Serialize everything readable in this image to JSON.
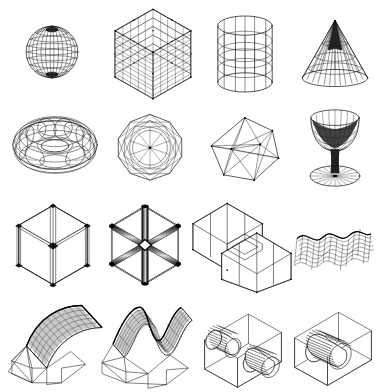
{
  "plate": {
    "title": "Wireframe 3D Geometry Plate",
    "background_color": "#ffffff",
    "ink_color": "#111111",
    "width": 380,
    "height": 392,
    "grid": {
      "columns": 4,
      "rows": 4,
      "cell_count": 16
    },
    "style_note": "monochrome line-art hidden-line wireframe renderings"
  },
  "figures": [
    {
      "index": 1,
      "row": 1,
      "column": 1,
      "name": "sphere-wireframe",
      "label": "Sphere",
      "description": "Latitude-longitude mesh sphere with dense poles",
      "shading": "hidden-line",
      "mesh": {
        "meridians": 16,
        "parallels": 12
      },
      "x": 14,
      "y": 14,
      "w": 76,
      "h": 76
    },
    {
      "index": 2,
      "row": 1,
      "column": 2,
      "name": "lattice-cube-grid",
      "label": "Lattice Cube",
      "description": "Isometric cube filled with a regular 3D grid lattice",
      "shading": "transparent-wireframe",
      "mesh": {
        "divisions": 5
      },
      "x": 110,
      "y": 8,
      "w": 86,
      "h": 92
    },
    {
      "index": 3,
      "row": 1,
      "column": 3,
      "name": "cylinder-wireframe",
      "label": "Cylinder",
      "description": "Open-ended cylinder with longitudinal and ring mesh",
      "shading": "transparent-wireframe",
      "mesh": {
        "meridians": 12,
        "rings": 6
      },
      "x": 205,
      "y": 12,
      "w": 80,
      "h": 84
    },
    {
      "index": 4,
      "row": 1,
      "column": 4,
      "name": "cone-wireframe",
      "label": "Cone",
      "description": "Cone with radial generators and circular parallels, dark apex",
      "shading": "hidden-line",
      "mesh": {
        "meridians": 20,
        "rings": 5
      },
      "x": 296,
      "y": 14,
      "w": 78,
      "h": 82
    },
    {
      "index": 5,
      "row": 2,
      "column": 1,
      "name": "torus-wireframe",
      "label": "Torus",
      "description": "Torus with tube and ring mesh, hidden-line removed",
      "shading": "hidden-line",
      "mesh": {
        "tube_segments": 20,
        "ring_segments": 28
      },
      "x": 10,
      "y": 106,
      "w": 90,
      "h": 78
    },
    {
      "index": 6,
      "row": 2,
      "column": 2,
      "name": "polyhedron-axial-view",
      "label": "Polyhedron",
      "description": "Icosidodecahedron-like polyhedron viewed down a symmetry axis",
      "shading": "transparent-wireframe",
      "mesh": {
        "outline_sides": 10
      },
      "x": 112,
      "y": 110,
      "w": 76,
      "h": 74
    },
    {
      "index": 7,
      "row": 2,
      "column": 3,
      "name": "icosahedron-wireframe",
      "label": "Icosahedron",
      "description": "Icosahedron drawn as a transparent edge skeleton",
      "shading": "transparent-wireframe",
      "mesh": {
        "faces": 20,
        "vertices": 12
      },
      "x": 206,
      "y": 114,
      "w": 78,
      "h": 70
    },
    {
      "index": 8,
      "row": 2,
      "column": 4,
      "name": "goblet-surface-of-revolution",
      "label": "Goblet",
      "description": "Wine glass surface of revolution with stem and circular foot",
      "shading": "hidden-line",
      "mesh": {
        "meridians": 18,
        "rings": 7
      },
      "x": 296,
      "y": 106,
      "w": 78,
      "h": 84
    },
    {
      "index": 9,
      "row": 3,
      "column": 1,
      "name": "cube-thin-tube-edges",
      "label": "Tube Cube (thin)",
      "description": "Cube edges modelled as slender cylinders, corner view",
      "shading": "outline-tubes",
      "tube_thickness": "thin",
      "x": 8,
      "y": 200,
      "w": 90,
      "h": 90
    },
    {
      "index": 10,
      "row": 3,
      "column": 2,
      "name": "cube-thick-tube-edges",
      "label": "Tube Cube (thick)",
      "description": "Cube edges modelled as fat shaded cylinders with highlights",
      "shading": "shaded-tubes",
      "tube_thickness": "thick",
      "x": 100,
      "y": 200,
      "w": 90,
      "h": 90
    },
    {
      "index": 11,
      "row": 3,
      "column": 3,
      "name": "interlocking-open-boxes",
      "label": "Linked Boxes",
      "description": "Two open-faced boxes threaded through one another",
      "shading": "hidden-line",
      "box_count": 2,
      "x": 190,
      "y": 196,
      "w": 104,
      "h": 100
    },
    {
      "index": 12,
      "row": 3,
      "column": 4,
      "name": "ripple-surface-patch",
      "label": "Wave Patch",
      "description": "Single-period corrugated surface patch drawn as a quad mesh",
      "shading": "hidden-line",
      "mesh": {
        "u": 14,
        "v": 10
      },
      "x": 292,
      "y": 212,
      "w": 82,
      "h": 68
    },
    {
      "index": 13,
      "row": 4,
      "column": 1,
      "name": "cylindrical-mesh-over-box",
      "label": "Arched Mesh",
      "description": "Dense cylindrical mesh sheet rising above an open wireframe box",
      "shading": "dense-mesh",
      "mesh": {
        "u": 40,
        "v": 16
      },
      "x": 6,
      "y": 300,
      "w": 100,
      "h": 92
    },
    {
      "index": 14,
      "row": 4,
      "column": 2,
      "name": "saddle-mesh-over-box",
      "label": "Saddle Mesh",
      "description": "Dense two-peak saddle surface above an open wireframe box",
      "shading": "dense-mesh",
      "mesh": {
        "u": 36,
        "v": 18
      },
      "x": 100,
      "y": 300,
      "w": 96,
      "h": 92
    },
    {
      "index": 15,
      "row": 4,
      "column": 3,
      "name": "two-cylinders-in-box",
      "label": "Two Cylinders",
      "description": "Pair of striped cylinders intersecting a transparent box",
      "shading": "striped-cylinders",
      "cylinder_count": 2,
      "x": 195,
      "y": 305,
      "w": 96,
      "h": 86
    },
    {
      "index": 16,
      "row": 4,
      "column": 4,
      "name": "single-cylinder-in-box",
      "label": "One Cylinder",
      "description": "Single striped cylinder passing through a transparent box",
      "shading": "striped-cylinders",
      "cylinder_count": 1,
      "x": 285,
      "y": 305,
      "w": 96,
      "h": 86
    }
  ]
}
